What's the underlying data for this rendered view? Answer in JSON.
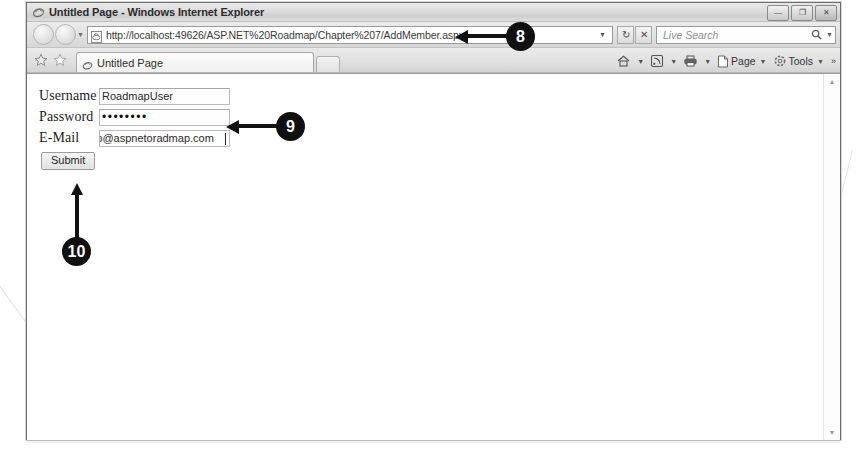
{
  "window": {
    "title": "Untitled Page - Windows Internet Explorer",
    "app_icon": "ie-logo-icon",
    "controls": {
      "minimize": "—",
      "restore": "❐",
      "close": "✕"
    }
  },
  "navigation": {
    "back_label": "Back",
    "forward_label": "Forward",
    "recent_pages_caret": "▼",
    "address": {
      "icon": "page-icon",
      "url": "http://localhost:49626/ASP.NET%20Roadmap/Chapter%207/AddMember.aspx",
      "dropdown_caret": "▼"
    },
    "refresh_label": "↻",
    "stop_label": "✕",
    "search": {
      "placeholder": "Live Search",
      "icon": "search-icon",
      "caret": "▼"
    }
  },
  "tabs": {
    "favorites_add": "☆",
    "favorites_center": "☆",
    "items": [
      {
        "label": "Untitled Page",
        "icon": "ie-logo-icon"
      }
    ],
    "new_tab_label": ""
  },
  "command_bar": {
    "items": [
      {
        "label": "",
        "icon": "home-icon",
        "caret": "▼"
      },
      {
        "label": "",
        "icon": "feeds-icon",
        "caret": "▼"
      },
      {
        "label": "",
        "icon": "print-icon",
        "caret": "▼"
      },
      {
        "label": "Page",
        "icon": "page-icon",
        "caret": "▼"
      },
      {
        "label": "Tools",
        "icon": "gear-icon",
        "caret": "▼"
      }
    ],
    "overflow": "»"
  },
  "page": {
    "form": {
      "fields": [
        {
          "label": "Username",
          "value": "RoadmapUser",
          "type": "text"
        },
        {
          "label": "Password",
          "value": "••••••••",
          "type": "password"
        },
        {
          "label": "E-Mail",
          "value": "roadmap@aspnetoradmap.com",
          "visible_value": "nap@aspnetoradmap.com",
          "type": "email"
        }
      ],
      "submit_label": "Submit"
    }
  },
  "scrollbar": {
    "up_arrow": "▲",
    "down_arrow": "▼"
  },
  "callouts": [
    {
      "number": "8",
      "target": "address-bar"
    },
    {
      "number": "9",
      "target": "password-field"
    },
    {
      "number": "10",
      "target": "submit-button"
    }
  ]
}
